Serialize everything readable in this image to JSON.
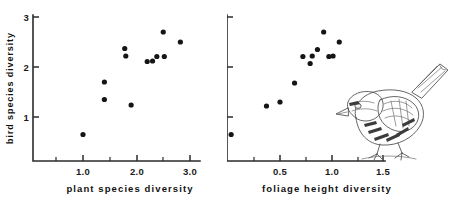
{
  "figure": {
    "title": "",
    "panels": [
      "left",
      "right"
    ]
  },
  "chart_data": [
    {
      "type": "scatter",
      "panel": "left",
      "title": "",
      "xlabel": "plant species diversity",
      "ylabel": "bird species diversity",
      "xlim": [
        0.45,
        3.25
      ],
      "ylim": [
        0.0,
        3.12
      ],
      "grid": false,
      "legend": null,
      "xticks": [
        1.0,
        2.0,
        3.0
      ],
      "xticklabels": [
        "1.0",
        "2.0",
        "3.0"
      ],
      "xminorticks": [
        1.5,
        2.5
      ],
      "yticks": [
        1,
        2,
        3
      ],
      "yticklabels": [
        "1",
        "2",
        "3"
      ],
      "marker": "filled-circle",
      "marker_color": "#151515",
      "n_points": 12,
      "x": [
        1.0,
        1.4,
        1.4,
        1.78,
        1.8,
        1.9,
        2.2,
        2.38,
        2.5,
        2.52,
        2.52,
        2.82
      ],
      "y": [
        0.65,
        1.35,
        1.7,
        2.37,
        2.22,
        1.24,
        2.11,
        2.21,
        2.21,
        2.7,
        2.21,
        2.5
      ],
      "points": [
        {
          "x": 1.0,
          "y": 0.65
        },
        {
          "x": 1.4,
          "y": 1.35
        },
        {
          "x": 1.4,
          "y": 1.7
        },
        {
          "x": 1.78,
          "y": 2.37
        },
        {
          "x": 1.8,
          "y": 2.22
        },
        {
          "x": 1.9,
          "y": 1.24
        },
        {
          "x": 2.2,
          "y": 2.11
        },
        {
          "x": 2.38,
          "y": 2.21
        },
        {
          "x": 2.5,
          "y": 2.7
        },
        {
          "x": 2.52,
          "y": 2.21
        },
        {
          "x": 2.82,
          "y": 2.5
        },
        {
          "x": 2.3,
          "y": 2.12
        }
      ]
    },
    {
      "type": "scatter",
      "panel": "right",
      "title": "",
      "xlabel": "foliage height diversity",
      "ylabel": "",
      "xlim": [
        0.0,
        1.62
      ],
      "ylim": [
        0.0,
        3.12
      ],
      "grid": false,
      "legend": null,
      "xticks": [
        0.5,
        1.0,
        1.5
      ],
      "xticklabels": [
        "0.5",
        "1.0",
        "1.5"
      ],
      "xminorticks": [
        0.25,
        0.75,
        1.25
      ],
      "yticks": [
        1,
        2,
        3
      ],
      "yticklabels": [
        "1",
        "2",
        "3"
      ],
      "marker": "filled-circle",
      "marker_color": "#151515",
      "n_points": 12,
      "x": [
        0.03,
        0.37,
        0.5,
        0.64,
        0.72,
        0.79,
        0.81,
        0.86,
        0.92,
        0.97,
        1.01,
        1.07
      ],
      "y": [
        0.65,
        1.22,
        1.3,
        1.68,
        2.21,
        2.07,
        2.22,
        2.35,
        2.7,
        2.21,
        2.22,
        2.5
      ],
      "points": [
        {
          "x": 0.03,
          "y": 0.65
        },
        {
          "x": 0.37,
          "y": 1.22
        },
        {
          "x": 0.5,
          "y": 1.3
        },
        {
          "x": 0.64,
          "y": 1.68
        },
        {
          "x": 0.72,
          "y": 2.21
        },
        {
          "x": 0.79,
          "y": 2.07
        },
        {
          "x": 0.81,
          "y": 2.22
        },
        {
          "x": 0.86,
          "y": 2.35
        },
        {
          "x": 0.92,
          "y": 2.7
        },
        {
          "x": 0.97,
          "y": 2.21
        },
        {
          "x": 1.01,
          "y": 2.22
        },
        {
          "x": 1.07,
          "y": 2.5
        }
      ]
    }
  ],
  "illustration": {
    "name": "bird-illustration",
    "subject": "perched songbird line drawing",
    "orientation": "facing left"
  },
  "colors": {
    "axis": "#2b2b2b",
    "marker": "#151515",
    "text": "#111111",
    "illustration_ink": "#4a4a4a",
    "background": "#ffffff"
  }
}
